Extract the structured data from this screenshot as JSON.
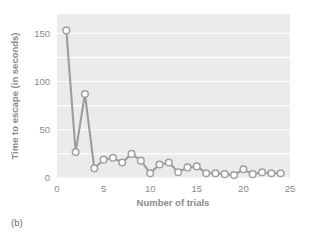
{
  "figure": {
    "panel_caption": "(b)",
    "background_color": "#ffffff"
  },
  "chart_data": {
    "type": "line",
    "title": "",
    "xlabel": "Number of trials",
    "ylabel": "Time to escape (in seconds)",
    "xlim": [
      0,
      25
    ],
    "ylim": [
      0,
      170
    ],
    "xticks": [
      0,
      5,
      10,
      15,
      20,
      25
    ],
    "yticks": [
      0,
      50,
      100,
      150
    ],
    "xtick_labels": [
      "0",
      "5",
      "10",
      "15",
      "20",
      "25"
    ],
    "ytick_labels": [
      "0",
      "50",
      "100",
      "150"
    ],
    "grid": true,
    "grid_color": "#ffffff",
    "plot_background": "#ebebeb",
    "legend": null,
    "marker": "circle",
    "marker_face_color": "#ffffff",
    "marker_edge_color": "#a0a0a0",
    "line_color": "#9d9d9d",
    "x": [
      1,
      2,
      3,
      4,
      5,
      6,
      7,
      8,
      9,
      10,
      11,
      12,
      13,
      14,
      15,
      16,
      17,
      18,
      19,
      20,
      21,
      22,
      23,
      24
    ],
    "values": [
      153,
      27,
      87,
      10,
      19,
      21,
      16,
      25,
      18,
      5,
      14,
      16,
      6,
      11,
      12,
      5,
      5,
      4,
      3,
      9,
      4,
      6,
      5,
      5
    ],
    "series": [
      {
        "name": "Time to escape",
        "values": [
          153,
          27,
          87,
          10,
          19,
          21,
          16,
          25,
          18,
          5,
          14,
          16,
          6,
          11,
          12,
          5,
          5,
          4,
          3,
          9,
          4,
          6,
          5,
          5
        ]
      }
    ]
  }
}
